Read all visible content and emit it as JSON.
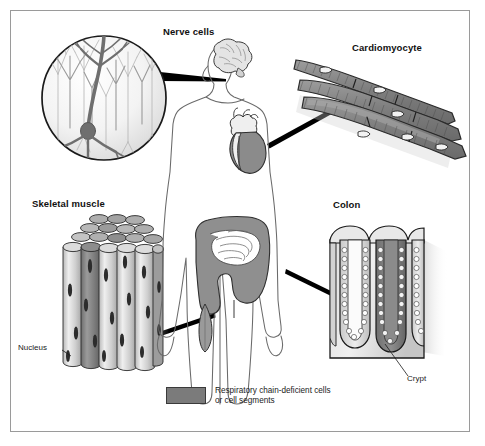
{
  "figure": {
    "background_color": "#ffffff",
    "frame_color": "#9a9a9a",
    "deficient_color": "#7b7b7b",
    "outline_color": "#1a1a1a"
  },
  "panels": {
    "nerve": {
      "label": "Nerve cells",
      "icon": "neuron-circle-inset",
      "description": "Circular magnified inset of cortical pyramidal neurons; one neuron shaded dark as respiratory chain-deficient"
    },
    "cardiomyocyte": {
      "label": "Cardiomyocyte",
      "icon": "cardiomyocyte-fibers",
      "description": "Branched striated cardiac muscle cells with intercalated discs and central nuclei; several segments shaded as deficient"
    },
    "skeletal": {
      "label": "Skeletal muscle",
      "icon": "muscle-fiber-bundle",
      "description": "Bundle of cylindrical skeletal muscle fibers with peripheral nuclei; some fiber segments shaded as deficient"
    },
    "colon": {
      "label": "Colon",
      "icon": "colon-crypts-block",
      "description": "Block of colonic mucosa showing crypts lined by epithelial cells; one crypt shaded as deficient"
    }
  },
  "callouts": {
    "nucleus": "Nucleus",
    "crypt": "Crypt"
  },
  "body_figure": {
    "name": "human-body-outline",
    "organs": [
      {
        "name": "brain",
        "deficient": false
      },
      {
        "name": "heart",
        "deficient": true
      },
      {
        "name": "colon",
        "deficient": true
      },
      {
        "name": "small-intestine",
        "deficient": false
      },
      {
        "name": "thigh-muscle",
        "deficient": true
      }
    ]
  },
  "legend": {
    "swatch_color": "#7b7b7b",
    "text": "Respiratory chain-deficient cells\nor cell segments"
  }
}
